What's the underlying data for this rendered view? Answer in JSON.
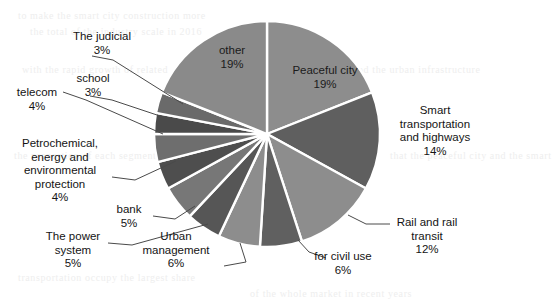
{
  "chart_data": {
    "type": "pie",
    "title": "",
    "subtitle": "",
    "xlabel": "",
    "ylabel": "",
    "legend_position": "none",
    "grid": false,
    "value_unit": "%",
    "total": 100,
    "start_angle_deg": 0,
    "direction": "clockwise",
    "categories": [
      "Peaceful city",
      "Smart transportation and highways",
      "Rail and rail transit",
      "for civil use",
      "Urban management",
      "The power system",
      "bank",
      "Petrochemical, energy and environmental protection",
      "telecom",
      "school",
      "The judicial",
      "other"
    ],
    "values": [
      19,
      14,
      12,
      6,
      6,
      5,
      5,
      4,
      4,
      3,
      3,
      19
    ],
    "slices": [
      {
        "label": "Peaceful city",
        "value": 19,
        "value_text": "19%",
        "color": "#8d8d8d",
        "label_placement": "inside"
      },
      {
        "label": "Smart transportation and highways",
        "value": 14,
        "value_text": "14%",
        "color": "#5f5f5f",
        "label_placement": "outside"
      },
      {
        "label": "Rail and rail transit",
        "value": 12,
        "value_text": "12%",
        "color": "#8d8d8d",
        "label_placement": "outside"
      },
      {
        "label": "for civil use",
        "value": 6,
        "value_text": "6%",
        "color": "#606060",
        "label_placement": "outside"
      },
      {
        "label": "Urban management",
        "value": 6,
        "value_text": "6%",
        "color": "#8d8d8d",
        "label_placement": "outside"
      },
      {
        "label": "The power system",
        "value": 5,
        "value_text": "5%",
        "color": "#565656",
        "label_placement": "outside"
      },
      {
        "label": "bank",
        "value": 5,
        "value_text": "5%",
        "color": "#777777",
        "label_placement": "outside"
      },
      {
        "label": "Petrochemical, energy and environmental protection",
        "value": 4,
        "value_text": "4%",
        "color": "#4e4e4e",
        "label_placement": "outside"
      },
      {
        "label": "telecom",
        "value": 4,
        "value_text": "4%",
        "color": "#6e6e6e",
        "label_placement": "outside"
      },
      {
        "label": "school",
        "value": 3,
        "value_text": "3%",
        "color": "#4a4a4a",
        "label_placement": "outside"
      },
      {
        "label": "The judicial",
        "value": 3,
        "value_text": "3%",
        "color": "#6a6a6a",
        "label_placement": "outside"
      },
      {
        "label": "other",
        "value": 19,
        "value_text": "19%",
        "color": "#8a8a8a",
        "label_placement": "inside"
      }
    ],
    "geometry": {
      "center_x": 267,
      "center_y": 134,
      "radius": 113,
      "separator_color": "#ffffff",
      "separator_width": 2.4
    },
    "colors": {
      "background": "#ffffff",
      "text": "#141414",
      "leader_line": "#4a4a4a",
      "mid_gray": "#8d8d8d",
      "dark_gray": "#5f5f5f"
    }
  },
  "labels": {
    "peaceful_city": {
      "name": "Peaceful city",
      "pct": "19%"
    },
    "other": {
      "name": "other",
      "pct": "19%"
    },
    "smart_transportation": {
      "line1": "Smart",
      "line2": "transportation",
      "line3": "and highways",
      "pct": "14%"
    },
    "rail_transit": {
      "line1": "Rail and rail",
      "line2": "transit",
      "pct": "12%"
    },
    "civil_use": {
      "name": "for civil use",
      "pct": "6%"
    },
    "urban_management": {
      "line1": "Urban",
      "line2": "management",
      "pct": "6%"
    },
    "power_system": {
      "line1": "The power",
      "line2": "system",
      "pct": "5%"
    },
    "bank": {
      "name": "bank",
      "pct": "5%"
    },
    "petrochemical": {
      "line1": "Petrochemical,",
      "line2": "energy and",
      "line3": "environmental",
      "line4": "protection",
      "pct": "4%"
    },
    "telecom": {
      "name": "telecom",
      "pct": "4%"
    },
    "school": {
      "name": "school",
      "pct": "3%"
    },
    "judicial": {
      "name": "The judicial",
      "pct": "3%"
    }
  },
  "background_bleed": {
    "lines": [
      "to make the smart city construction more",
      "the total of the industry scale in 2016",
      "with the rapid growth of related",
      "investment and the urban infrastructure",
      "the proportion of each segment shows",
      "that the peaceful city and the smart",
      "transportation occupy the largest share",
      "of the whole market in recent years"
    ]
  }
}
